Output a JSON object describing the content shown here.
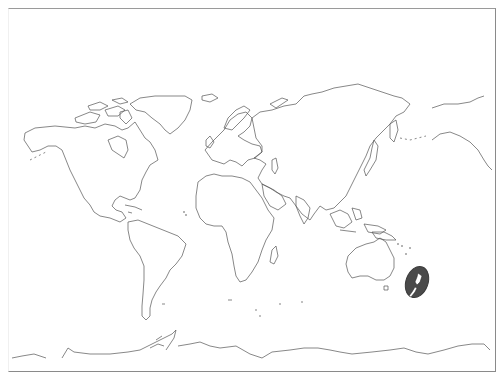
{
  "map": {
    "type": "world-outline",
    "projection": "equirectangular-like",
    "highlighted_region": "New Zealand",
    "colors": {
      "background": "#ffffff",
      "coastline": "#555555",
      "highlight_fill": "#4a4a4a",
      "frame": "#8a8a8a"
    },
    "caption": ""
  }
}
